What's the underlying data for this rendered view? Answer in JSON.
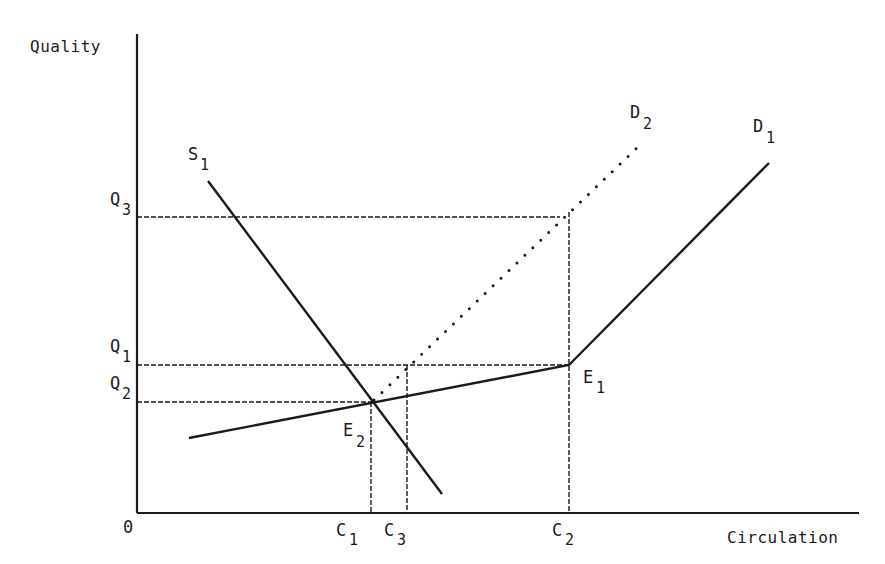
{
  "diagram": {
    "type": "economics supply-demand diagram",
    "axes": {
      "y_label": "Quality",
      "x_label": "Circulation",
      "origin_label": "0"
    },
    "curves": {
      "supply": {
        "name": "S",
        "sub": "1",
        "style": "solid"
      },
      "demand1": {
        "name": "D",
        "sub": "1",
        "style": "solid (kinked at E1)"
      },
      "demand2": {
        "name": "D",
        "sub": "2",
        "style": "dotted"
      }
    },
    "equilibria": {
      "e1": {
        "name": "E",
        "sub": "1"
      },
      "e2": {
        "name": "E",
        "sub": "2"
      }
    },
    "y_ticks": [
      {
        "name": "Q",
        "sub": "3"
      },
      {
        "name": "Q",
        "sub": "1"
      },
      {
        "name": "Q",
        "sub": "2"
      }
    ],
    "x_ticks": [
      {
        "name": "C",
        "sub": "1"
      },
      {
        "name": "C",
        "sub": "3"
      },
      {
        "name": "C",
        "sub": "2"
      }
    ]
  }
}
